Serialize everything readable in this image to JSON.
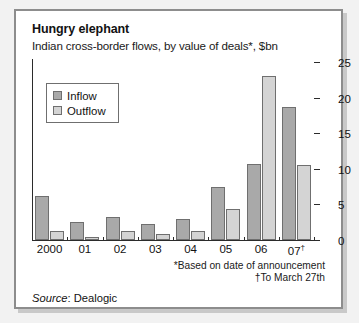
{
  "header": {
    "title": "Hungry elephant",
    "subtitle": "Indian cross-border flows, by value of deals*, $bn"
  },
  "legend": {
    "inflow_label": "Inflow",
    "outflow_label": "Outflow"
  },
  "footnotes": {
    "line1": "*Based on date of announcement",
    "line2": "†To March 27th"
  },
  "source": {
    "label": "Source",
    "separator": ": ",
    "value": "Dealogic"
  },
  "colors": {
    "inflow": "#a9a9a9",
    "outflow": "#d4d4d4",
    "frame": "#8d8d8d",
    "axis": "#2b2b2b",
    "background": "#f2f2f2",
    "panel": "#ffffff"
  },
  "chart_data": {
    "type": "bar",
    "title": "Hungry elephant",
    "subtitle": "Indian cross-border flows, by value of deals*, $bn",
    "xlabel": "",
    "ylabel": "$bn",
    "ylim": [
      0,
      25
    ],
    "yticks": [
      0,
      5,
      10,
      15,
      20,
      25
    ],
    "grid": false,
    "legend_position": "top-left",
    "categories": [
      "2000",
      "01",
      "02",
      "03",
      "04",
      "05",
      "06",
      "07†"
    ],
    "series": [
      {
        "name": "Inflow",
        "values": [
          6.2,
          2.6,
          3.2,
          2.2,
          2.9,
          7.5,
          10.7,
          18.7
        ]
      },
      {
        "name": "Outflow",
        "values": [
          1.3,
          0.4,
          1.2,
          0.9,
          1.3,
          4.3,
          23.0,
          10.5
        ]
      }
    ],
    "annotations": [
      "*Based on date of announcement",
      "†To March 27th"
    ],
    "source": "Source: Dealogic"
  }
}
